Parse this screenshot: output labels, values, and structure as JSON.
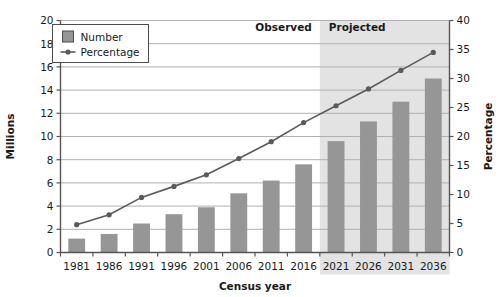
{
  "chart_data": {
    "type": "bar",
    "title": "",
    "xlabel": "Census year",
    "ylabel": "Millions",
    "y2label": "Percentage",
    "categories": [
      "1981",
      "1986",
      "1991",
      "1996",
      "2001",
      "2006",
      "2011",
      "2016",
      "2021",
      "2026",
      "2031",
      "2036"
    ],
    "ylim": [
      0,
      20
    ],
    "y2lim": [
      0,
      40
    ],
    "yticks": [
      "0",
      "2",
      "4",
      "6",
      "8",
      "10",
      "12",
      "14",
      "16",
      "18",
      "20"
    ],
    "ytick_values": [
      0,
      2,
      4,
      6,
      8,
      10,
      12,
      14,
      16,
      18,
      20
    ],
    "y2ticks": [
      "0",
      "5",
      "10",
      "15",
      "20",
      "25",
      "30",
      "35",
      "40"
    ],
    "y2tick_values": [
      0,
      5,
      10,
      15,
      20,
      25,
      30,
      35,
      40
    ],
    "grid": true,
    "legend_position": "top-left",
    "series": [
      {
        "name": "Number",
        "type": "bar",
        "axis": "left",
        "unit": "Millions",
        "color": "#969696",
        "values": [
          1.2,
          1.6,
          2.5,
          3.3,
          3.9,
          5.1,
          6.2,
          7.6,
          9.6,
          11.3,
          13.0,
          15.0
        ]
      },
      {
        "name": "Percentage",
        "type": "line",
        "axis": "right",
        "unit": "Percentage",
        "color": "#5a5a5a",
        "values": [
          4.8,
          6.5,
          9.5,
          11.4,
          13.4,
          16.2,
          19.1,
          22.4,
          25.3,
          28.2,
          31.4,
          34.5
        ]
      }
    ],
    "annotations": [
      {
        "label": "Observed",
        "from": "1981",
        "to": "2016",
        "shaded": false
      },
      {
        "label": "Projected",
        "from": "2021",
        "to": "2036",
        "shaded": true
      }
    ],
    "colors": {
      "bar": "#969696",
      "line": "#5a5a5a",
      "marker": "#5a5a5a",
      "grid": "#b0b0b0",
      "axis": "#555555",
      "projected_shade": "#e3e3e3",
      "text": "#1a1a1a",
      "legend_border": "#4d4d4d",
      "plot_background": "#ffffff"
    }
  },
  "legend": {
    "items": [
      {
        "label": "Number",
        "marker": "square-swatch"
      },
      {
        "label": "Percentage",
        "marker": "line-with-dot"
      }
    ]
  }
}
